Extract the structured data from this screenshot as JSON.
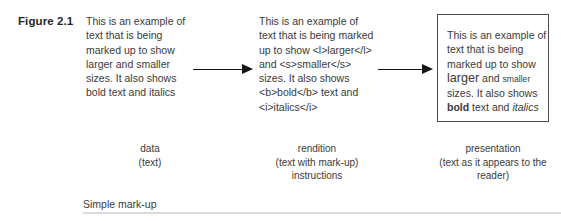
{
  "figure": {
    "label": "Figure 2.1",
    "footer_label": "Simple mark-up"
  },
  "columns": {
    "data": {
      "body": "This is an example of text that is being marked up to show larger and smaller sizes. It also shows bold text and italics",
      "caption_title": "data",
      "caption_sub": "(text)"
    },
    "rendition": {
      "body": "This is an example of text that is being marked up to show <l>larger</l> and <s>smaller</s> sizes. It also shows <b>bold</b> text and <i>italics</i>",
      "caption_title": "rendition",
      "caption_sub": "(text with mark-up) instructions"
    },
    "presentation": {
      "segments": {
        "lead": "This is an example of text that is being marked up to show ",
        "larger": "larger",
        "and": " and ",
        "smaller": "smaller",
        "middle": " sizes. It also shows ",
        "bold": "bold",
        "text_and": " text and ",
        "italics": "italics"
      },
      "caption_title": "presentation",
      "caption_sub": "(text as it appears to the reader)"
    }
  },
  "arrows": {
    "first": "arrow-data-to-rendition",
    "second": "arrow-rendition-to-presentation"
  },
  "colors": {
    "text": "#3a3a3a",
    "box_border": "#4a4a4a",
    "arrow": "#151515",
    "rule": "#dadada"
  }
}
